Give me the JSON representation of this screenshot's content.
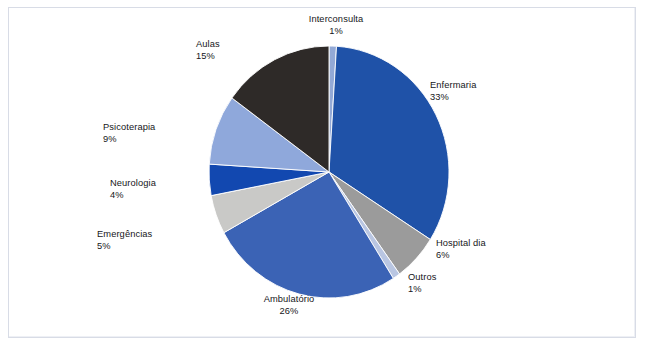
{
  "figure": {
    "background_color": "#ffffff",
    "border_color": "#d8dce6"
  },
  "chart_data": {
    "type": "pie",
    "title": "",
    "subtitle": "",
    "xlabel": "",
    "ylabel": "",
    "legend_position": "none",
    "grid": false,
    "label_format": "name + percentage",
    "start_angle_deg": 90,
    "direction": "clockwise",
    "units": "percent",
    "total": 100,
    "categories": [
      "Interconsulta",
      "Enfermaria",
      "Hospital dia",
      "Outros",
      "Ambulatório",
      "Emergências",
      "Neurologia",
      "Psicoterapia",
      "Aulas"
    ],
    "values": [
      1,
      33,
      6,
      1,
      26,
      5,
      4,
      9,
      15
    ],
    "value_labels": [
      "1%",
      "33%",
      "6%",
      "1%",
      "26%",
      "5%",
      "4%",
      "9%",
      "15%"
    ],
    "colors": [
      "#93a9d6",
      "#1f52a8",
      "#9b9b9b",
      "#b9c6e2",
      "#3b63b5",
      "#c9c9c7",
      "#1248b0",
      "#8fa8db",
      "#2e2a28"
    ],
    "slices": [
      {
        "name": "Interconsulta",
        "value": 1,
        "value_label": "1%",
        "color": "#93a9d6"
      },
      {
        "name": "Enfermaria",
        "value": 33,
        "value_label": "33%",
        "color": "#1f52a8"
      },
      {
        "name": "Hospital dia",
        "value": 6,
        "value_label": "6%",
        "color": "#9b9b9b"
      },
      {
        "name": "Outros",
        "value": 1,
        "value_label": "1%",
        "color": "#b9c6e2"
      },
      {
        "name": "Ambulatório",
        "value": 26,
        "value_label": "26%",
        "color": "#3b63b5"
      },
      {
        "name": "Emergências",
        "value": 5,
        "value_label": "5%",
        "color": "#c9c9c7"
      },
      {
        "name": "Neurologia",
        "value": 4,
        "value_label": "4%",
        "color": "#1248b0"
      },
      {
        "name": "Psicoterapia",
        "value": 9,
        "value_label": "9%",
        "color": "#8fa8db"
      },
      {
        "name": "Aulas",
        "value": 15,
        "value_label": "15%",
        "color": "#2e2a28"
      }
    ]
  },
  "labels": {
    "interconsulta": {
      "name": "Interconsulta",
      "value": "1%"
    },
    "enfermaria": {
      "name": "Enfermaria",
      "value": "33%"
    },
    "hospital_dia": {
      "name": "Hospital dia",
      "value": "6%"
    },
    "outros": {
      "name": "Outros",
      "value": "1%"
    },
    "ambulatorio": {
      "name": "Ambulatório",
      "value": "26%"
    },
    "emergencias": {
      "name": "Emergências",
      "value": "5%"
    },
    "neurologia": {
      "name": "Neurologia",
      "value": "4%"
    },
    "psicoterapia": {
      "name": "Psicoterapia",
      "value": "9%"
    },
    "aulas": {
      "name": "Aulas",
      "value": "15%"
    }
  }
}
